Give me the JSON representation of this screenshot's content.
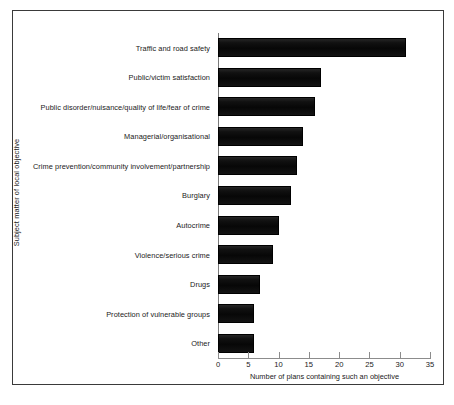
{
  "chart_data": {
    "type": "bar",
    "orientation": "horizontal",
    "title": "",
    "xlabel": "Number of plans containing such an objective",
    "ylabel": "Subject matter of local objective",
    "xlim": [
      0,
      35
    ],
    "xticks": [
      0,
      5,
      10,
      15,
      20,
      25,
      30,
      35
    ],
    "grid": false,
    "legend": null,
    "bar_color": "#111111",
    "categories": [
      "Traffic and road safety",
      "Public/victim satisfaction",
      "Public disorder/nuisance/quality of life/fear of crime",
      "Managerial/organisational",
      "Crime prevention/community involvement/partnership",
      "Burglary",
      "Autocrime",
      "Violence/serious crime",
      "Drugs",
      "Protection of vulnerable groups",
      "Other"
    ],
    "values": [
      31,
      17,
      16,
      14,
      13,
      12,
      10,
      9,
      7,
      6,
      6
    ]
  },
  "axes": {
    "x_title": "Number of plans containing such an objective",
    "y_title": "Subject matter of local objective",
    "x_tick_labels": [
      "0",
      "5",
      "10",
      "15",
      "20",
      "25",
      "30",
      "35"
    ]
  }
}
